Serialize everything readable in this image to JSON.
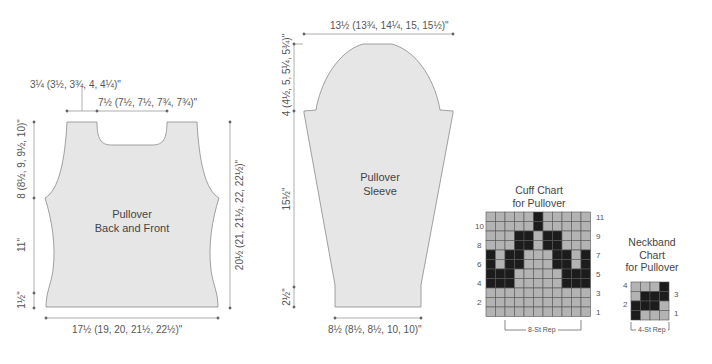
{
  "body_piece": {
    "label_line1": "Pullover",
    "label_line2": "Back and Front",
    "shoulder_width": "3¼ (3½, 3¾, 4, 4¼)\"",
    "neck_width": "7½ (7½, 7½, 7¾, 7¾)\"",
    "armhole_depth": "8 (8½, 9, 9½, 10)\"",
    "side_length": "11\"",
    "hem_depth": "1½\"",
    "total_length": "20½ (21, 21½, 22, 22½)\"",
    "width": "17½ (19, 20, 21½, 22½)\""
  },
  "sleeve_piece": {
    "label_line1": "Pullover",
    "label_line2": "Sleeve",
    "upper_width": "13½ (13¾, 14¼, 15, 15½)\"",
    "cap_depth": "4 (4½, 5, 5¼, 5¾)\"",
    "taper_length": "15½\"",
    "cuff_depth": "2½\"",
    "cuff_width": "8½ (8½, 8½, 10, 10)\""
  },
  "cuff_chart": {
    "title_line1": "Cuff Chart",
    "title_line2": "for Pullover",
    "repeat_label": "8-St Rep",
    "left_row_numbers": [
      "10",
      "8",
      "6",
      "4",
      "2"
    ],
    "right_row_numbers": [
      "11",
      "9",
      "7",
      "5",
      "3",
      "1"
    ],
    "rows_top_to_bottom": [
      "LLLLLDLLLLL",
      "LLLLLDLLLLL",
      "LLLDDLDDLLL",
      "LLLDDLDDLLL",
      "DLDDLLLDDLD",
      "DLDDLLLDDLD",
      "DDDLLLLLDDD",
      "DDDLLLLLDDD",
      "LLLLLLLLLLL",
      "LLLLLLLLLLL",
      "LLLLLLLLLLL"
    ]
  },
  "neckband_chart": {
    "title_line1": "Neckband",
    "title_line2": "Chart",
    "title_line3": "for Pullover",
    "repeat_label": "4-St Rep",
    "left_row_numbers": [
      "4",
      "2"
    ],
    "right_row_numbers": [
      "3",
      "1"
    ],
    "rows_top_to_bottom": [
      "LLLD",
      "LDDD",
      "DDDL",
      "DLLL"
    ]
  },
  "colors": {
    "piece_fill": "#e6e6e6",
    "piece_stroke": "#8a8a8a",
    "dim_line": "#9a9a9a",
    "chart_light": "#b3b3b3",
    "chart_dark": "#1c1c1c",
    "chart_grid": "#555555"
  }
}
